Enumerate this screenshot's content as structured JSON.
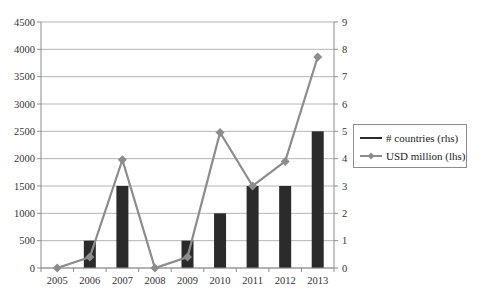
{
  "chart_data": {
    "type": "bar+line",
    "title": "",
    "categories": [
      "2005",
      "2006",
      "2007",
      "2008",
      "2009",
      "2010",
      "2011",
      "2012",
      "2013"
    ],
    "series": [
      {
        "name": "# countries (rhs)",
        "type": "bar",
        "axis": "right",
        "color": "#2b2b2b",
        "values": [
          0,
          1,
          3,
          0,
          1,
          2,
          3,
          3,
          5
        ]
      },
      {
        "name": "USD million (lhs)",
        "type": "line",
        "axis": "left",
        "color": "#8c8c8c",
        "marker": "diamond",
        "values": [
          0,
          200,
          1980,
          0,
          200,
          2480,
          1500,
          1950,
          3860
        ]
      }
    ],
    "left_axis": {
      "ylim": [
        0,
        4500
      ],
      "ticks": [
        "0",
        "500",
        "1000",
        "1500",
        "2000",
        "2500",
        "3000",
        "3500",
        "4000",
        "4500"
      ]
    },
    "right_axis": {
      "ylim": [
        0,
        9
      ],
      "ticks": [
        "0",
        "1",
        "2",
        "3",
        "4",
        "5",
        "6",
        "7",
        "8",
        "9"
      ]
    },
    "xlabel": "",
    "ylabel": "",
    "grid": true,
    "legend_position": "right"
  },
  "legend": {
    "items": [
      {
        "label": "# countries (rhs)"
      },
      {
        "label": "USD million (lhs)"
      }
    ]
  }
}
